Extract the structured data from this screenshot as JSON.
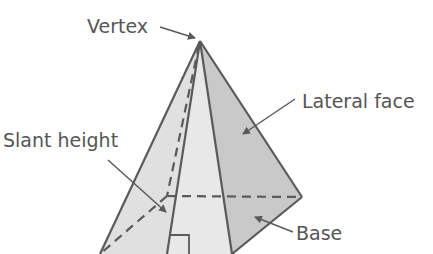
{
  "diagram": {
    "labels": {
      "vertex": "Vertex",
      "lateral_face": "Lateral face",
      "slant_height": "Slant height",
      "base": "Base"
    },
    "colors": {
      "stroke": "#5a5a5a",
      "label_text": "#555555",
      "front_face_fill": "#e6e6e6",
      "left_face_fill": "#dedede",
      "right_face_fill": "#c9c9c9",
      "background": "#ffffff"
    }
  }
}
